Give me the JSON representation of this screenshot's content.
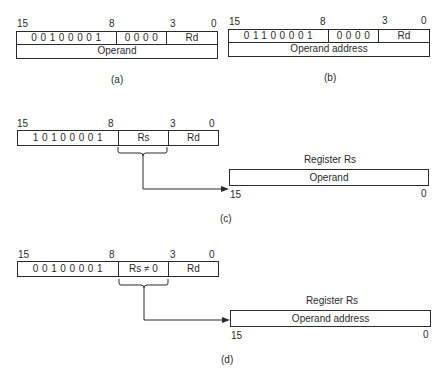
{
  "figures": {
    "a": {
      "caption": "(a)",
      "bit_labels": {
        "b15": "15",
        "b8": "8",
        "b3": "3",
        "b0": "0"
      },
      "opcode_bits": "00100001",
      "field2": "0000",
      "field3": "Rd",
      "second_word": "Operand"
    },
    "b": {
      "caption": "(b)",
      "bit_labels": {
        "b15": "15",
        "b8": "8",
        "b3": "3",
        "b0": "0"
      },
      "opcode_bits": "01100001",
      "field2": "0000",
      "field3": "Rd",
      "second_word": "Operand address"
    },
    "c": {
      "caption": "(c)",
      "bit_labels": {
        "b15": "15",
        "b8": "8",
        "b3": "3",
        "b0": "0"
      },
      "opcode_bits": "10100001",
      "field2": "Rs",
      "field3": "Rd",
      "register": {
        "title": "Register Rs",
        "content": "Operand",
        "bit_high": "15",
        "bit_low": "0"
      }
    },
    "d": {
      "caption": "(d)",
      "bit_labels": {
        "b15": "15",
        "b8": "8",
        "b3": "3",
        "b0": "0"
      },
      "opcode_bits": "00100001",
      "field2": "Rs ≠ 0",
      "field3": "Rd",
      "register": {
        "title": "Register Rs",
        "content": "Operand address",
        "bit_high": "15",
        "bit_low": "0"
      }
    }
  },
  "colors": {
    "ink": "#2a2a2a",
    "background": "#ffffff"
  }
}
